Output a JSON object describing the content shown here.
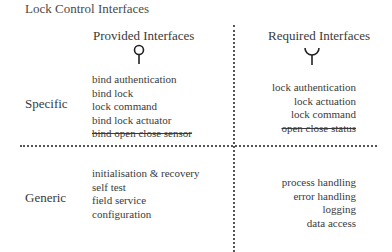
{
  "title": "Lock Control Interfaces",
  "columns": {
    "provided": {
      "label": "Provided Interfaces",
      "icon": "provided-interface-lollipop-icon"
    },
    "required": {
      "label": "Required Interfaces",
      "icon": "required-interface-socket-icon"
    }
  },
  "rows": {
    "specific": {
      "label": "Specific"
    },
    "generic": {
      "label": "Generic"
    }
  },
  "cells": {
    "specific_provided": [
      {
        "text": "bind authentication",
        "struck": false
      },
      {
        "text": "bind lock",
        "struck": false
      },
      {
        "text": "lock command",
        "struck": false
      },
      {
        "text": "bind lock actuator",
        "struck": false
      },
      {
        "text": "bind open close sensor",
        "struck": true
      }
    ],
    "specific_required": [
      {
        "text": "lock authentication",
        "struck": false
      },
      {
        "text": "lock actuation",
        "struck": false
      },
      {
        "text": "lock command",
        "struck": false
      },
      {
        "text": "open close status",
        "struck": true
      }
    ],
    "generic_provided": [
      {
        "text": "initialisation & recovery",
        "struck": false
      },
      {
        "text": "self test",
        "struck": false
      },
      {
        "text": "field service",
        "struck": false
      },
      {
        "text": "configuration",
        "struck": false
      }
    ],
    "generic_required": [
      {
        "text": "process handling",
        "struck": false
      },
      {
        "text": "error handling",
        "struck": false
      },
      {
        "text": "logging",
        "struck": false
      },
      {
        "text": "data access",
        "struck": false
      }
    ]
  }
}
